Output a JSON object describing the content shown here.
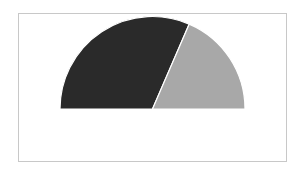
{
  "chart_data": {
    "type": "pie",
    "variant": "half-donut-semicircle",
    "title": "",
    "categories": [
      "Dark slice",
      "Light slice"
    ],
    "values": [
      63,
      37
    ],
    "colors": [
      "#2a2a2a",
      "#a8a8a8"
    ],
    "legend": "none",
    "labels_visible": false,
    "start_angle_deg": 180,
    "sweep_deg": 180,
    "separator_color": "#ffffff"
  },
  "frame": {
    "border_color": "#c8c8c8",
    "background": "#ffffff"
  },
  "geometry": {
    "cx": 152.5,
    "cy": 109,
    "r": 92.5
  }
}
